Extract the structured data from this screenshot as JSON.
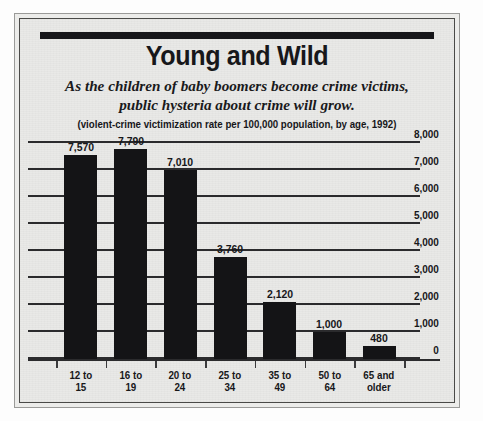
{
  "title": "Young and Wild",
  "subtitle": "As the children of baby boomers become crime victims, public hysteria about crime will grow.",
  "subnote": "(violent-crime victimization rate per 100,000 population, by age, 1992)",
  "source": "Source: Bureau of Justice Statistics Bulletin, Criminal Victimization 1992, October 1993",
  "colors": {
    "bar": "#141416",
    "paper": "#e9e9e7",
    "ink": "#17171a",
    "rule": "#2b2b2d"
  },
  "chart_data": {
    "type": "bar",
    "title": "Young and Wild",
    "subtitle": "As the children of baby boomers become crime victims, public hysteria about crime will grow.",
    "xlabel": "",
    "ylabel": "violent-crime victimization rate per 100,000 population",
    "ylim": [
      0,
      8000
    ],
    "yticks": [
      0,
      1000,
      2000,
      3000,
      4000,
      5000,
      6000,
      7000,
      8000
    ],
    "ytick_labels": [
      "0",
      "1,000",
      "2,000",
      "3,000",
      "4,000",
      "5,000",
      "6,000",
      "7,000",
      "8,000"
    ],
    "y_axis_position": "right",
    "grid": true,
    "legend": false,
    "categories": [
      "12 to 15",
      "16 to 19",
      "20 to 24",
      "25 to 34",
      "35 to 49",
      "50 to 64",
      "65 and older"
    ],
    "values": [
      7570,
      7790,
      7010,
      3760,
      2120,
      1000,
      480
    ],
    "data_labels": [
      "7,570",
      "7,790",
      "7,010",
      "3,760",
      "2,120",
      "1,000",
      "480"
    ],
    "category_lines": [
      [
        "12 to",
        "15"
      ],
      [
        "16 to",
        "19"
      ],
      [
        "20 to",
        "24"
      ],
      [
        "25 to",
        "34"
      ],
      [
        "35 to",
        "49"
      ],
      [
        "50 to",
        "64"
      ],
      [
        "65 and",
        "older"
      ]
    ]
  }
}
